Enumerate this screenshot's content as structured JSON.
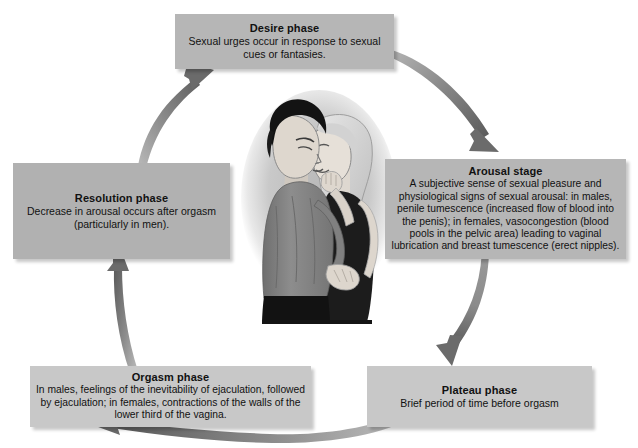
{
  "figure": {
    "title": "Human sexual response cycle",
    "background_color": "#ffffff",
    "box_color": "#b6b6b6",
    "arrow_color": "#6e6e6e",
    "text_color": "#111111"
  },
  "center_image": {
    "name": "couple-embracing-illustration",
    "description": "Illustration of a man and a woman embracing and kissing",
    "colors": {
      "man_shirt": "#8a8a8a",
      "man_hair": "#1c1c1c",
      "man_pants": "#141414",
      "woman_dress": "#1a1a1a",
      "woman_hair": "#d9d9d9",
      "skin": "#e2ddd6",
      "halo": "#cccccc"
    }
  },
  "phases": [
    {
      "id": "desire",
      "title": "Desire phase",
      "body": "Sexual urges occur in response to sexual cues or fantasies.",
      "position": "top"
    },
    {
      "id": "arousal",
      "title": "Arousal stage",
      "body": "A subjective sense of sexual pleasure and physiological signs of sexual arousal: in males, penile tumescence (increased flow of blood into the penis); in females, vasocongestion (blood pools in the pelvic area) leading to vaginal lubrication and breast tumescence (erect nipples).",
      "position": "right"
    },
    {
      "id": "plateau",
      "title": "Plateau phase",
      "body": "Brief period of time before orgasm",
      "position": "bottom-right"
    },
    {
      "id": "orgasm",
      "title": "Orgasm phase",
      "body": "In males, feelings of the inevitability of ejaculation, followed by ejaculation; in females, contractions of the walls of the lower third of the vagina.",
      "position": "bottom-left"
    },
    {
      "id": "resolution",
      "title": "Resolution phase",
      "body": "Decrease in arousal occurs after orgasm (particularly in men).",
      "position": "left"
    }
  ],
  "arrows": [
    {
      "id": "resolution-to-desire",
      "from": "resolution",
      "to": "desire",
      "direction": "up-right"
    },
    {
      "id": "desire-to-arousal",
      "from": "desire",
      "to": "arousal",
      "direction": "down-right"
    },
    {
      "id": "arousal-to-plateau",
      "from": "arousal",
      "to": "plateau",
      "direction": "down"
    },
    {
      "id": "plateau-to-orgasm",
      "from": "plateau",
      "to": "orgasm",
      "direction": "left"
    },
    {
      "id": "orgasm-to-resolution",
      "from": "orgasm",
      "to": "resolution",
      "direction": "up"
    }
  ]
}
